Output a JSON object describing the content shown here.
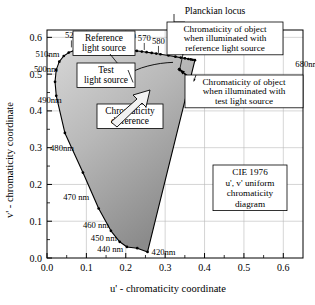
{
  "figure": {
    "xlabel": "u' - chromaticity coordinate",
    "ylabel": "v' - chromaticity coordinate",
    "caption_box": [
      "CIE 1976",
      "u', v' uniform",
      "chromaticity",
      "diagram"
    ]
  },
  "annotations": {
    "planckian": "Planckian locus",
    "reference_source": [
      "Reference",
      "light source"
    ],
    "test_source": [
      "Test",
      "light source"
    ],
    "chromaticity_difference": [
      "Chromaticity",
      "difference"
    ],
    "obj_reference": [
      "Chromaticity of object",
      "when illuminated with",
      "reference light source"
    ],
    "obj_test": [
      "Chromaticity of object",
      "when illuminated with",
      "test light source"
    ]
  },
  "axes": {
    "x_ticks": [
      "0.0",
      "0.1",
      "0.2",
      "0.3",
      "0.4",
      "0.5",
      "0.6"
    ],
    "x_tick_values": [
      0.0,
      0.1,
      0.2,
      0.3,
      0.4,
      0.5,
      0.6
    ],
    "y_ticks": [
      "0.0",
      "0.1",
      "0.2",
      "0.3",
      "0.4",
      "0.5",
      "0.6"
    ],
    "y_tick_values": [
      0.0,
      0.1,
      0.2,
      0.3,
      0.4,
      0.5,
      0.6
    ],
    "xlim": [
      0.0,
      0.65
    ],
    "ylim": [
      0.0,
      0.62
    ],
    "grid": true
  },
  "wavelength_labels": [
    {
      "text": "520",
      "u": 0.062,
      "v": 0.57,
      "anchor": "top"
    },
    {
      "text": "530",
      "u": 0.095,
      "v": 0.574,
      "anchor": "top"
    },
    {
      "text": "540",
      "u": 0.129,
      "v": 0.575,
      "anchor": "top"
    },
    {
      "text": "550",
      "u": 0.168,
      "v": 0.572,
      "anchor": "top"
    },
    {
      "text": "560",
      "u": 0.209,
      "v": 0.568,
      "anchor": "top"
    },
    {
      "text": "570",
      "u": 0.247,
      "v": 0.563,
      "anchor": "top"
    },
    {
      "text": "580",
      "u": 0.283,
      "v": 0.555,
      "anchor": "top"
    },
    {
      "text": "510nm",
      "u": 0.039,
      "v": 0.556,
      "anchor": "left"
    },
    {
      "text": "500nm",
      "u": 0.035,
      "v": 0.514,
      "anchor": "left"
    },
    {
      "text": "490nm",
      "u": 0.045,
      "v": 0.43,
      "anchor": "left"
    },
    {
      "text": "480nm",
      "u": 0.076,
      "v": 0.3,
      "anchor": "left"
    },
    {
      "text": "470 nm",
      "u": 0.115,
      "v": 0.165,
      "anchor": "left"
    },
    {
      "text": "460 nm",
      "u": 0.165,
      "v": 0.09,
      "anchor": "left"
    },
    {
      "text": "450 nm",
      "u": 0.185,
      "v": 0.055,
      "anchor": "left"
    },
    {
      "text": "440 nm",
      "u": 0.201,
      "v": 0.025,
      "anchor": "left"
    },
    {
      "text": "420nm",
      "u": 0.258,
      "v": 0.016,
      "anchor": "right"
    },
    {
      "text": "680nm",
      "u": 0.623,
      "v": 0.527,
      "anchor": "right"
    }
  ],
  "chart_data": {
    "type": "scatter",
    "xlabel": "u' - chromaticity coordinate",
    "ylabel": "v' - chromaticity coordinate",
    "xlim": [
      0.0,
      0.65
    ],
    "ylim": [
      0.0,
      0.62
    ],
    "grid": true,
    "legend": "none",
    "spectral_locus": {
      "name": "spectral locus (monochromatic boundary)",
      "unit": "nm",
      "points": [
        {
          "nm": 420,
          "u": 0.2553,
          "v": 0.0165
        },
        {
          "nm": 430,
          "u": 0.2292,
          "v": 0.0266
        },
        {
          "nm": 440,
          "u": 0.203,
          "v": 0.03
        },
        {
          "nm": 450,
          "u": 0.1846,
          "v": 0.044
        },
        {
          "nm": 460,
          "u": 0.1623,
          "v": 0.074
        },
        {
          "nm": 470,
          "u": 0.1312,
          "v": 0.1346
        },
        {
          "nm": 480,
          "u": 0.0912,
          "v": 0.2324
        },
        {
          "nm": 490,
          "u": 0.0454,
          "v": 0.3401
        },
        {
          "nm": 500,
          "u": 0.0235,
          "v": 0.4411
        },
        {
          "nm": 505,
          "u": 0.0204,
          "v": 0.4792
        },
        {
          "nm": 510,
          "u": 0.0234,
          "v": 0.5115
        },
        {
          "nm": 515,
          "u": 0.0312,
          "v": 0.534
        },
        {
          "nm": 520,
          "u": 0.0425,
          "v": 0.5493
        },
        {
          "nm": 525,
          "u": 0.0552,
          "v": 0.5586
        },
        {
          "nm": 530,
          "u": 0.069,
          "v": 0.5644
        },
        {
          "nm": 535,
          "u": 0.0834,
          "v": 0.5682
        },
        {
          "nm": 540,
          "u": 0.0983,
          "v": 0.5703
        },
        {
          "nm": 545,
          "u": 0.1135,
          "v": 0.5715
        },
        {
          "nm": 550,
          "u": 0.1289,
          "v": 0.5718
        },
        {
          "nm": 555,
          "u": 0.1441,
          "v": 0.5713
        },
        {
          "nm": 560,
          "u": 0.1589,
          "v": 0.5704
        },
        {
          "nm": 565,
          "u": 0.1734,
          "v": 0.5693
        },
        {
          "nm": 570,
          "u": 0.1876,
          "v": 0.5679
        },
        {
          "nm": 575,
          "u": 0.2013,
          "v": 0.5664
        },
        {
          "nm": 580,
          "u": 0.2148,
          "v": 0.5648
        },
        {
          "nm": 585,
          "u": 0.228,
          "v": 0.5631
        },
        {
          "nm": 590,
          "u": 0.2407,
          "v": 0.5614
        },
        {
          "nm": 595,
          "u": 0.253,
          "v": 0.5596
        },
        {
          "nm": 600,
          "u": 0.2658,
          "v": 0.5577
        },
        {
          "nm": 605,
          "u": 0.2774,
          "v": 0.5559
        },
        {
          "nm": 610,
          "u": 0.2881,
          "v": 0.5541
        },
        {
          "nm": 620,
          "u": 0.3084,
          "v": 0.5507
        },
        {
          "nm": 630,
          "u": 0.326,
          "v": 0.5475
        },
        {
          "nm": 640,
          "u": 0.3396,
          "v": 0.5449
        },
        {
          "nm": 650,
          "u": 0.3503,
          "v": 0.5429
        },
        {
          "nm": 660,
          "u": 0.3589,
          "v": 0.5412
        },
        {
          "nm": 670,
          "u": 0.365,
          "v": 0.54
        },
        {
          "nm": 680,
          "u": 0.3697,
          "v": 0.5391
        },
        {
          "nm": 700,
          "u": 0.3756,
          "v": 0.5379
        }
      ]
    },
    "planckian_locus": {
      "name": "Planckian locus",
      "points": [
        {
          "u": 0.32,
          "v": 0.532
        },
        {
          "u": 0.305,
          "v": 0.531
        },
        {
          "u": 0.288,
          "v": 0.529
        },
        {
          "u": 0.272,
          "v": 0.526
        },
        {
          "u": 0.256,
          "v": 0.522
        },
        {
          "u": 0.24,
          "v": 0.517
        },
        {
          "u": 0.226,
          "v": 0.511
        },
        {
          "u": 0.215,
          "v": 0.505
        },
        {
          "u": 0.206,
          "v": 0.499
        },
        {
          "u": 0.199,
          "v": 0.494
        },
        {
          "u": 0.195,
          "v": 0.49
        }
      ]
    },
    "markers": [
      {
        "name": "reference-light-source",
        "u": 0.202,
        "v": 0.492,
        "label": "Reference light source"
      },
      {
        "name": "test-light-source",
        "u": 0.216,
        "v": 0.48,
        "label": "Test light source"
      },
      {
        "name": "object-under-reference",
        "u": 0.336,
        "v": 0.513,
        "label": "Chromaticity of object when illuminated with reference light source"
      },
      {
        "name": "object-under-test",
        "u": 0.37,
        "v": 0.483,
        "label": "Chromaticity of object when illuminated with test light source"
      }
    ]
  },
  "colors": {
    "gamut_fill_light": "#cfcfcf",
    "gamut_fill_dark": "#8f8f8f",
    "line": "#000000",
    "grid": "#b9b9b9",
    "box_bg": "#ffffff"
  }
}
